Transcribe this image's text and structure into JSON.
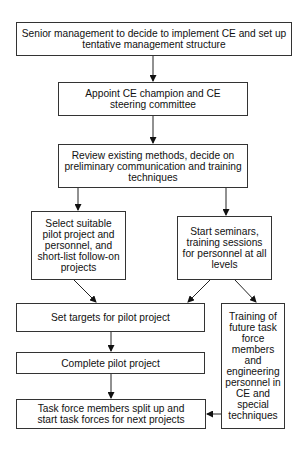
{
  "diagram": {
    "type": "flowchart",
    "nodes": [
      {
        "id": "n1",
        "label": "Senior management to decide to implement CE and set up tentative management structure"
      },
      {
        "id": "n2",
        "label": "Appoint CE champion and CE steering committee"
      },
      {
        "id": "n3",
        "label": "Review existing methods, decide on preliminary communication and training techniques"
      },
      {
        "id": "n4",
        "label": "Select suitable pilot project and personnel, and short-list follow-on projects"
      },
      {
        "id": "n5",
        "label": "Start seminars, training sessions for personnel at all levels"
      },
      {
        "id": "n6",
        "label": "Set targets for pilot project"
      },
      {
        "id": "n7",
        "label": "Training of future task force members and engineering personnel in CE and special techniques"
      },
      {
        "id": "n8",
        "label": "Complete pilot project"
      },
      {
        "id": "n9",
        "label": "Task force members split up and start task forces for next projects"
      }
    ],
    "edges": [
      {
        "from": "n1",
        "to": "n2"
      },
      {
        "from": "n2",
        "to": "n3"
      },
      {
        "from": "n3",
        "to": "n4"
      },
      {
        "from": "n3",
        "to": "n5"
      },
      {
        "from": "n4",
        "to": "n6"
      },
      {
        "from": "n5",
        "to": "n6"
      },
      {
        "from": "n5",
        "to": "n7"
      },
      {
        "from": "n6",
        "to": "n8"
      },
      {
        "from": "n8",
        "to": "n9"
      },
      {
        "from": "n7",
        "to": "n9"
      }
    ]
  }
}
